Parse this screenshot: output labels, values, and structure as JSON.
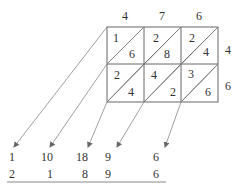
{
  "top_factor_digits": [
    "4",
    "7",
    "6"
  ],
  "side_factor_digits": [
    "4",
    "6"
  ],
  "cells": [
    [
      {
        "tens": "1",
        "ones": "6"
      },
      {
        "tens": "2",
        "ones": "8"
      },
      {
        "tens": "2",
        "ones": "4"
      }
    ],
    [
      {
        "tens": "2",
        "ones": "4"
      },
      {
        "tens": "4",
        "ones": "2"
      },
      {
        "tens": "3",
        "ones": "6"
      }
    ]
  ],
  "diagonal_sums": [
    "1",
    "10",
    "18",
    "9",
    "6"
  ],
  "result_digits": [
    "2",
    "1",
    "8",
    "9",
    "6"
  ],
  "colors": {
    "line": "#555555",
    "arrow": "#777777",
    "text": "#333333"
  }
}
